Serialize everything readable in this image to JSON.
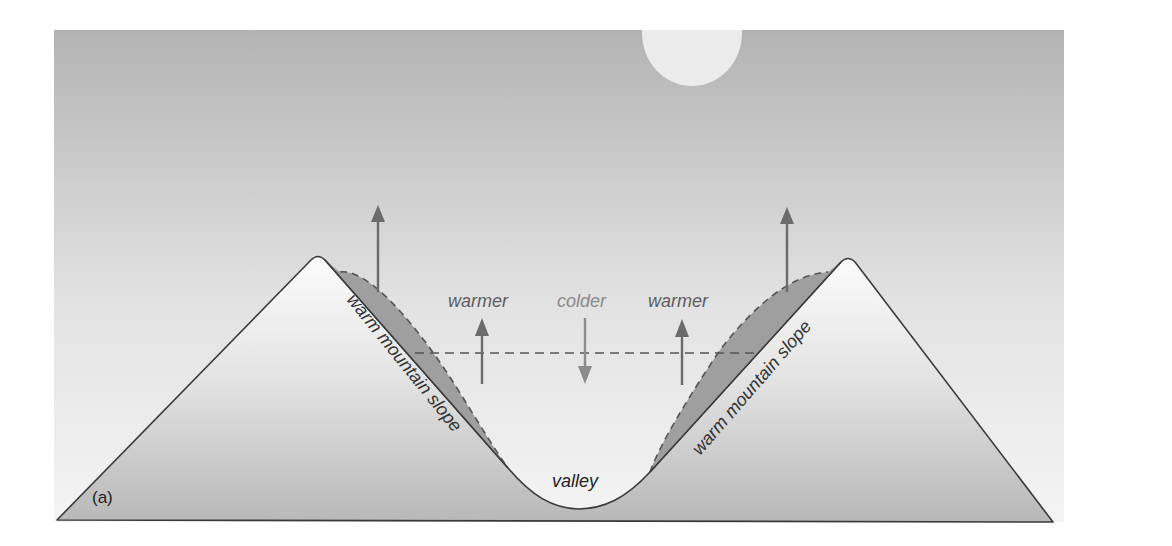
{
  "figure": {
    "panel_label": "(a)",
    "labels": {
      "warm_slope_left": "warm mountain slope",
      "warm_slope_right": "warm mountain slope",
      "warmer_left": "warmer",
      "colder": "colder",
      "warmer_right": "warmer",
      "valley": "valley"
    },
    "colors": {
      "sky_top": "#b4b4b4",
      "sky_bottom": "#f4f4f4",
      "mountain_top": "#fafafa",
      "mountain_bottom": "#b9b9b9",
      "warm_layer": "#9d9d9d",
      "arrow_dark": "#6b6b6b",
      "arrow_light": "#8c8c8c",
      "outline": "#3a3a3a",
      "moon": "#ececec"
    }
  }
}
